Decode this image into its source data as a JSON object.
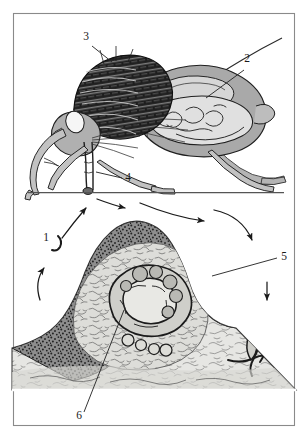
{
  "figure": {
    "border_color": "#8a8a8a",
    "background": "#ffffff",
    "ink_color": "#1a1a1a",
    "panels": [
      {
        "name": "upper-panel",
        "subject": "adult fly depositing eggs on ground",
        "ground_line": true
      },
      {
        "name": "lower-panel",
        "subject": "histological cross-section of skin containing larva"
      }
    ]
  },
  "labels": [
    {
      "id": "label-3",
      "text": "3",
      "x": 86,
      "y": 40,
      "target": "thorax-wing-base",
      "leader": true
    },
    {
      "id": "label-2",
      "text": "2",
      "x": 247,
      "y": 62,
      "target": "abdomen-internal-organs",
      "leader": true
    },
    {
      "id": "label-4",
      "text": "4",
      "x": 128,
      "y": 181,
      "target": "proboscis-egg-deposit",
      "leader": true
    },
    {
      "id": "label-1",
      "text": "1",
      "x": 46,
      "y": 241,
      "target": "cycle-start-arrow",
      "leader": false
    },
    {
      "id": "label-5",
      "text": "5",
      "x": 284,
      "y": 260,
      "target": "skin-epidermis-surface",
      "leader": true
    },
    {
      "id": "label-6",
      "text": "6",
      "x": 79,
      "y": 419,
      "target": "larva-in-tissue",
      "leader": true
    }
  ],
  "colors": {
    "fly_body_mid": "#a8a8a8",
    "fly_body_light": "#d2d2d2",
    "fly_thorax_dark": "#2a2a2a",
    "fly_outline": "#1f1f1f",
    "tissue_fill": "#e3e3e0",
    "tissue_epidermis": "#6b6b6b",
    "tissue_stipple": "#4a4a4a",
    "ground_line": "#555555",
    "arrow": "#1a1a1a",
    "border": "#8a8a8a"
  }
}
